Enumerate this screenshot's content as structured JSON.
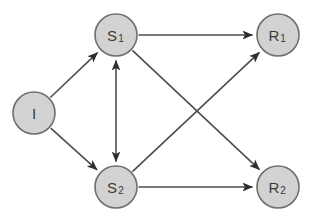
{
  "diagram": {
    "background_color": "#ffffff",
    "node_fill_color": "#d2d2d2",
    "node_stroke_color": "#6e6e6e",
    "edge_color": "#4d4d4d",
    "label_color": "#3a3a3a",
    "node_radius": 21,
    "nodes": [
      {
        "id": "I",
        "base": "I",
        "sub": "",
        "cx": 34,
        "cy": 113,
        "role": "source"
      },
      {
        "id": "S1",
        "base": "S",
        "sub": "1",
        "cx": 116,
        "cy": 35,
        "role": "relay"
      },
      {
        "id": "S2",
        "base": "S",
        "sub": "2",
        "cx": 116,
        "cy": 187,
        "role": "relay"
      },
      {
        "id": "R1",
        "base": "R",
        "sub": "1",
        "cx": 278,
        "cy": 35,
        "role": "destination"
      },
      {
        "id": "R2",
        "base": "R",
        "sub": "2",
        "cx": 278,
        "cy": 187,
        "role": "destination"
      }
    ],
    "edges": [
      {
        "id": "I-S1",
        "from": "I",
        "to": "S1",
        "direction": "forward",
        "style": "diagonal"
      },
      {
        "id": "I-S2",
        "from": "I",
        "to": "S2",
        "direction": "forward",
        "style": "diagonal"
      },
      {
        "id": "S1-S2",
        "from": "S1",
        "to": "S2",
        "direction": "bidirectional",
        "style": "vertical"
      },
      {
        "id": "S1-R1",
        "from": "S1",
        "to": "R1",
        "direction": "forward",
        "style": "horizontal"
      },
      {
        "id": "S1-R2",
        "from": "S1",
        "to": "R2",
        "direction": "forward",
        "style": "diagonal"
      },
      {
        "id": "S2-R1",
        "from": "S2",
        "to": "R1",
        "direction": "forward",
        "style": "diagonal"
      },
      {
        "id": "S2-R2",
        "from": "S2",
        "to": "R2",
        "direction": "forward",
        "style": "horizontal"
      }
    ]
  }
}
